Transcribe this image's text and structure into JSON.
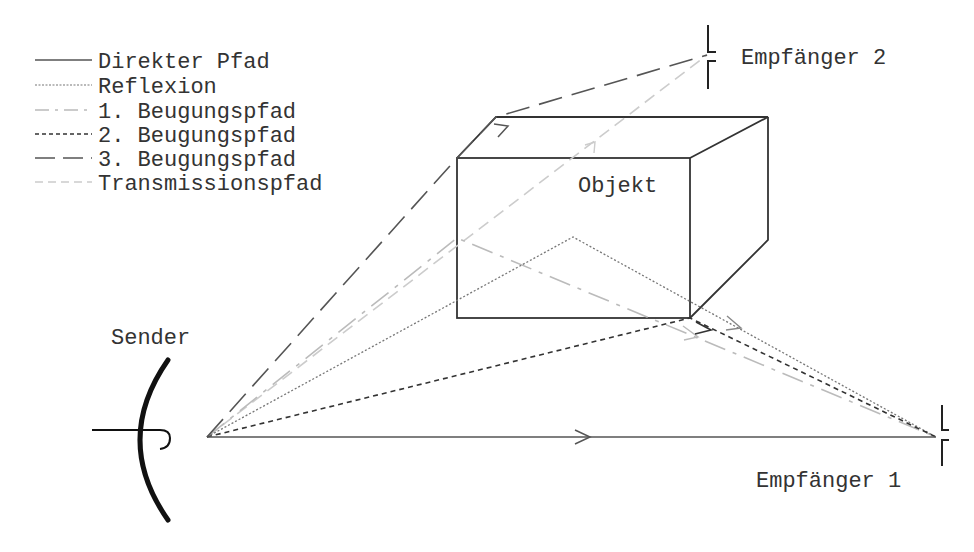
{
  "legend": {
    "items": [
      {
        "label": "Direkter Pfad",
        "style": "solid",
        "color": "#555555"
      },
      {
        "label": "Reflexion",
        "style": "dotted",
        "color": "#777777"
      },
      {
        "label": "1. Beugungspfad",
        "style": "dash-dot",
        "color": "#bbbbbb"
      },
      {
        "label": "2. Beugungspfad",
        "style": "short-dash",
        "color": "#333333"
      },
      {
        "label": "3. Beugungspfad",
        "style": "long-dash",
        "color": "#555555"
      },
      {
        "label": "Transmissionspfad",
        "style": "dashed",
        "color": "#cccccc"
      }
    ]
  },
  "labels": {
    "sender": "Sender",
    "receiver1": "Empfänger 1",
    "receiver2": "Empfänger 2",
    "object": "Objekt"
  },
  "colors": {
    "stroke": "#333333",
    "direct": "#555555",
    "reflection": "#777777",
    "diff1": "#bbbbbb",
    "diff2": "#333333",
    "diff3": "#555555",
    "transmission": "#cccccc"
  }
}
